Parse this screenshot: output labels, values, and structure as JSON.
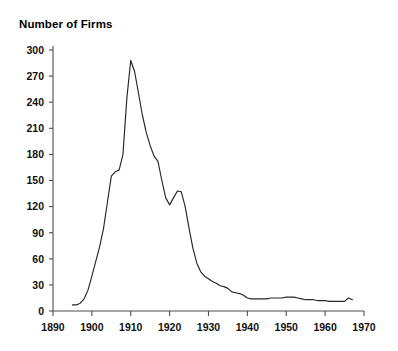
{
  "chart_data": {
    "type": "line",
    "title": "Number of Firms",
    "xlabel": "",
    "ylabel": "",
    "xlim": [
      1890,
      1970
    ],
    "ylim": [
      0,
      300
    ],
    "grid": false,
    "legend": null,
    "x_ticks": [
      1890,
      1900,
      1910,
      1920,
      1930,
      1940,
      1950,
      1960,
      1970
    ],
    "y_ticks": [
      0,
      30,
      60,
      90,
      120,
      150,
      180,
      210,
      240,
      270,
      300
    ],
    "series": [
      {
        "name": "Number of Firms",
        "color": "#262626",
        "x": [
          1895,
          1896,
          1897,
          1898,
          1899,
          1900,
          1901,
          1902,
          1903,
          1904,
          1905,
          1906,
          1907,
          1908,
          1909,
          1910,
          1911,
          1912,
          1913,
          1914,
          1915,
          1916,
          1917,
          1918,
          1919,
          1920,
          1921,
          1922,
          1923,
          1924,
          1925,
          1926,
          1927,
          1928,
          1929,
          1930,
          1931,
          1932,
          1933,
          1934,
          1935,
          1936,
          1937,
          1938,
          1939,
          1940,
          1941,
          1942,
          1943,
          1944,
          1945,
          1946,
          1947,
          1948,
          1949,
          1950,
          1951,
          1952,
          1953,
          1954,
          1955,
          1956,
          1957,
          1958,
          1959,
          1960,
          1961,
          1962,
          1963,
          1964,
          1965,
          1966,
          1967
        ],
        "y": [
          7,
          7,
          9,
          14,
          24,
          40,
          57,
          74,
          95,
          125,
          155,
          160,
          162,
          180,
          245,
          288,
          275,
          250,
          225,
          205,
          190,
          178,
          172,
          150,
          130,
          122,
          130,
          138,
          137,
          120,
          95,
          72,
          55,
          45,
          40,
          37,
          34,
          32,
          29,
          28,
          26,
          22,
          21,
          20,
          18,
          15,
          14,
          14,
          14,
          14,
          14,
          15,
          15,
          15,
          15,
          16,
          16,
          16,
          15,
          14,
          13,
          13,
          13,
          12,
          12,
          12,
          11,
          11,
          11,
          11,
          11,
          15,
          13
        ]
      }
    ]
  }
}
